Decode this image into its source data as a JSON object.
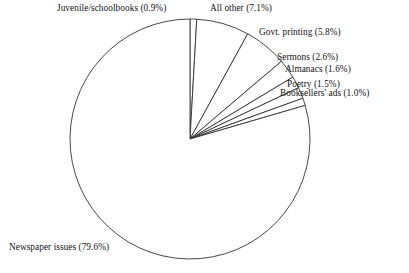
{
  "chart_data": {
    "type": "pie",
    "title": "",
    "subtitle": "",
    "xlabel": "",
    "ylabel": "",
    "legend_position": "none",
    "grid": false,
    "start_angle_deg": 0,
    "direction": "clockwise",
    "units": "percent",
    "categories": [
      "Juvenile/schoolbooks",
      "All other",
      "Govt. printing",
      "Sermons",
      "Almanacs",
      "Poetry",
      "Booksellers' ads",
      "Newspaper issues"
    ],
    "values": [
      0.9,
      7.1,
      5.8,
      2.6,
      1.6,
      1.5,
      1.0,
      79.6
    ],
    "labels": [
      "Juvenile/schoolbooks (0.9%)",
      "All other (7.1%)",
      "Govt. printing (5.8%)",
      "Sermons (2.6%)",
      "Almanacs (1.6%)",
      "Poetry (1.5%)",
      "Booksellers' ads (1.0%)",
      "Newspaper issues (79.6%)"
    ],
    "slice_fill": "#ffffff",
    "slice_stroke": "#333333",
    "total": 100.1
  },
  "geometry": {
    "center_x": 190,
    "center_y": 139,
    "radius": 120
  }
}
